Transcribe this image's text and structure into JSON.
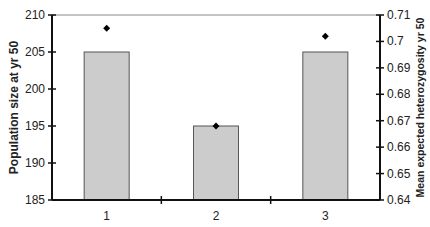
{
  "chart_data": {
    "type": "bar",
    "title": "",
    "categories": [
      "1",
      "2",
      "3"
    ],
    "xlabel": "",
    "series": [
      {
        "name": "Population size at yr 50",
        "type": "bar",
        "axis": "left",
        "values": [
          205,
          195,
          205
        ],
        "color": "#cccccc"
      },
      {
        "name": "Mean expected heterozygosity yr 50",
        "type": "scatter",
        "marker": "diamond",
        "axis": "right",
        "values": [
          0.705,
          0.668,
          0.702
        ],
        "color": "#000000"
      }
    ],
    "ylabel": "Population size at yr 50",
    "ylim": [
      185,
      210
    ],
    "yticks": [
      "185",
      "190",
      "195",
      "200",
      "205",
      "210"
    ],
    "y2label": "Mean expected heterozygosity yr 50",
    "y2lim": [
      0.64,
      0.71
    ],
    "y2ticks": [
      "0.64",
      "0.65",
      "0.66",
      "0.67",
      "0.68",
      "0.69",
      "0.7",
      "0.71"
    ],
    "grid": false,
    "legend": null
  }
}
